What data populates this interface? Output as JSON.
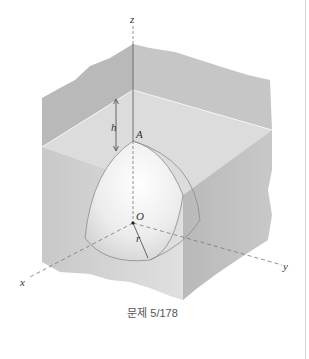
{
  "figure": {
    "caption": "문제 5/178",
    "labels": {
      "z_axis": "z",
      "x_axis": "x",
      "y_axis": "y",
      "point_A": "A",
      "origin": "O",
      "height": "h",
      "radius": "r"
    },
    "colors": {
      "block_top": "#d6d6d6",
      "block_front_left": "#c9c9c9",
      "block_front_right": "#bdbdbd",
      "back_wall_left": "#b8b8b8",
      "back_wall_right": "#c4c4c4",
      "cavity": "#f2f2f2",
      "axis_line": "#555555",
      "rule": "#d8d8d8"
    }
  }
}
